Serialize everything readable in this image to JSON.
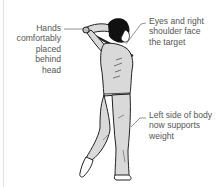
{
  "diagram": {
    "annotations": [
      {
        "id": "hands",
        "lines": [
          "Hands",
          "comfortably",
          "placed",
          "behind head"
        ]
      },
      {
        "id": "eyes",
        "lines": [
          "Eyes and right",
          "shoulder face",
          "the target"
        ]
      },
      {
        "id": "left_side",
        "lines": [
          "Left side of body",
          "now supports",
          "weight"
        ]
      }
    ],
    "colors": {
      "outline": "#222222",
      "fill_light": "#d9d9d9",
      "hair": "#111111",
      "label_text": "#555555",
      "leader_line": "#666666"
    }
  }
}
